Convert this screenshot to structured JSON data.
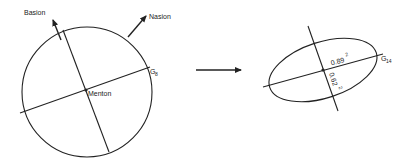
{
  "diagram": {
    "left": {
      "shape": "circle",
      "labels": {
        "basion": "Basion",
        "nasion": "Nasion",
        "menton": "Menton",
        "g_main": "G",
        "g_sub": "8"
      }
    },
    "transform_arrow": "right-arrow",
    "right": {
      "shape": "ellipse",
      "labels": {
        "major_value": "0.89",
        "major_exp": "2",
        "minor_value": "0.62",
        "minor_exp": "2",
        "g_main": "G",
        "g_sub": "14"
      }
    },
    "colors": {
      "stroke": "#222222",
      "background": "#ffffff"
    }
  }
}
